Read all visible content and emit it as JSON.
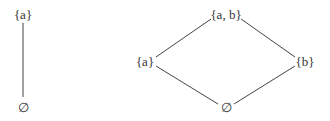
{
  "diagrams": [
    {
      "name": "hasse-diagram-one-element",
      "nodes": [
        {
          "id": "a",
          "label": "{a}",
          "x": 23,
          "y": 14
        },
        {
          "id": "empty",
          "label": "∅",
          "x": 23,
          "y": 107
        }
      ],
      "edges": [
        [
          "a",
          "empty"
        ]
      ]
    },
    {
      "name": "hasse-diagram-two-element",
      "nodes": [
        {
          "id": "ab",
          "label": "{a, b}",
          "x": 226,
          "y": 14
        },
        {
          "id": "a",
          "label": "{a}",
          "x": 145,
          "y": 61
        },
        {
          "id": "b",
          "label": "{b}",
          "x": 305,
          "y": 61
        },
        {
          "id": "empty",
          "label": "∅",
          "x": 226,
          "y": 107
        }
      ],
      "edges": [
        [
          "ab",
          "a"
        ],
        [
          "ab",
          "b"
        ],
        [
          "a",
          "empty"
        ],
        [
          "b",
          "empty"
        ]
      ]
    }
  ],
  "colors": {
    "line": "#444444",
    "text": "#333333"
  }
}
